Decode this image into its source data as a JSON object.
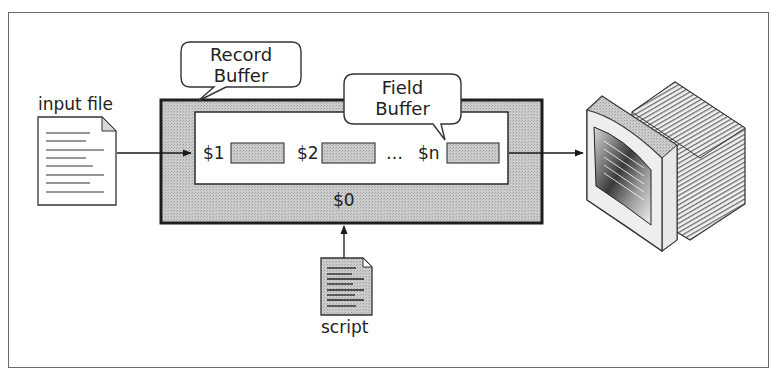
{
  "diagram": {
    "type": "awk data flow",
    "input_file": {
      "label": "input file",
      "icon": "document-icon"
    },
    "record_buffer": {
      "callout": "Record\nBuffer",
      "callout_line1": "Record",
      "callout_line2": "Buffer",
      "label": "$0"
    },
    "field_buffer": {
      "callout_line1": "Field",
      "callout_line2": "Buffer",
      "fields": [
        {
          "label": "$1"
        },
        {
          "label": "$2"
        },
        {
          "label": "$n"
        }
      ],
      "ellipsis": "…"
    },
    "script": {
      "label": "script",
      "icon": "script-document-icon"
    },
    "output": {
      "icon": "monitor-icon"
    },
    "colors": {
      "buffer_fill": "#c8c8c8",
      "field_fill": "#cfcfcf",
      "border": "#2a2a2a",
      "frame": "#6a6a6a",
      "background": "#ffffff"
    }
  }
}
